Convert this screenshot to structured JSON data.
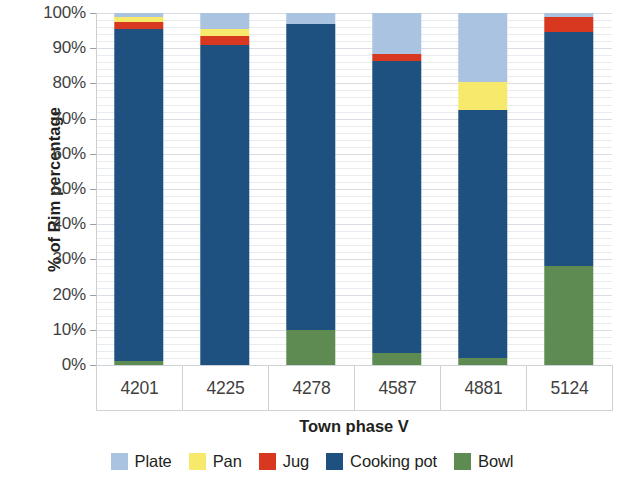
{
  "chart_data": {
    "type": "bar",
    "subtype": "stacked-100-percent",
    "title": "",
    "xlabel": "Town phase V",
    "ylabel": "% of Rim percentage",
    "categories": [
      "4201",
      "4225",
      "4278",
      "4587",
      "4881",
      "5124"
    ],
    "ylim": [
      0,
      100
    ],
    "ytick_labels": [
      "0%",
      "10%",
      "20%",
      "30%",
      "40%",
      "50%",
      "60%",
      "70%",
      "80%",
      "90%",
      "100%"
    ],
    "ytick_values": [
      0,
      10,
      20,
      30,
      40,
      50,
      60,
      70,
      80,
      90,
      100
    ],
    "grid": true,
    "legend_position": "bottom",
    "stack_order_bottom_to_top": [
      "Bowl",
      "Cooking pot",
      "Jug",
      "Pan",
      "Plate"
    ],
    "series": [
      {
        "name": "Plate",
        "color": "#a9c3e0",
        "values": [
          1.0,
          4.5,
          3.0,
          11.5,
          19.5,
          1.0
        ]
      },
      {
        "name": "Pan",
        "color": "#f7e96b",
        "values": [
          1.5,
          2.0,
          0.0,
          0.0,
          8.0,
          0.0
        ]
      },
      {
        "name": "Jug",
        "color": "#d8381f",
        "values": [
          2.0,
          2.5,
          0.0,
          2.0,
          0.0,
          4.5
        ]
      },
      {
        "name": "Cooking pot",
        "color": "#1e5180",
        "values": [
          94.5,
          91.0,
          87.0,
          83.0,
          70.5,
          66.5
        ]
      },
      {
        "name": "Bowl",
        "color": "#5e8b51",
        "values": [
          1.0,
          0.0,
          10.0,
          3.5,
          2.0,
          28.0
        ]
      }
    ]
  },
  "legend": {
    "items": [
      {
        "label": "Plate"
      },
      {
        "label": "Pan"
      },
      {
        "label": "Jug"
      },
      {
        "label": "Cooking pot"
      },
      {
        "label": "Bowl"
      }
    ]
  },
  "axes": {
    "y_title": "% of Rim percentage",
    "x_title": "Town phase V"
  }
}
